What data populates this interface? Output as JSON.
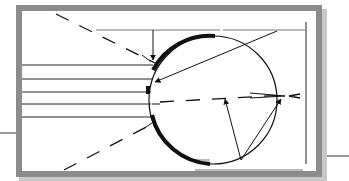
{
  "diagram": {
    "type": "optics-eye-ray-diagram",
    "colors": {
      "background": "#ffffff",
      "frame": "#8c8c8c",
      "frame_shadow": "#b5b5b5",
      "ink": "#111111",
      "guide_line": "#777777"
    },
    "labels": [],
    "elements": {
      "parallel_rays_count": 6,
      "dashed_rays_count": 3,
      "leader_arrows_count": 4,
      "focal_point": "right of the eye"
    }
  }
}
